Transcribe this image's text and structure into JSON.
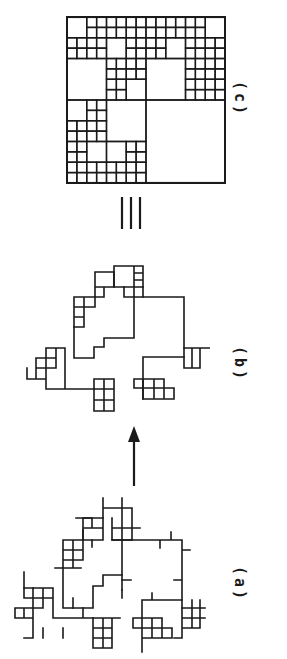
{
  "figure": {
    "orientation": "rotated-90-clockwise",
    "ink_color": "#1a1a1a",
    "background_color": "#ffffff",
    "panels": [
      {
        "id": "a",
        "label": "(a)",
        "description": "Fractal lattice cluster with dangling bonds and small square loops"
      },
      {
        "id": "b",
        "label": "(b)",
        "description": "Reduced cluster: backbone with blobs of unit cells (dangling ends removed)"
      },
      {
        "id": "c",
        "label": "(c)",
        "description": "Equivalent quadtree-like hierarchical square tiling on a 16x16 grid"
      }
    ],
    "connectors": [
      {
        "from": "a",
        "to": "b",
        "symbol": "arrow"
      },
      {
        "from": "b",
        "to": "c",
        "symbol": "≡"
      }
    ]
  },
  "labels": {
    "a": "(a)",
    "b": "(b)",
    "c": "(c)",
    "equiv": "≡"
  },
  "quadtree": {
    "grid": 16,
    "big_cells": [
      {
        "x": 0,
        "y": 0,
        "s": 2
      },
      {
        "x": 14,
        "y": 0,
        "s": 2
      },
      {
        "x": 4,
        "y": 2,
        "s": 2
      },
      {
        "x": 10,
        "y": 2,
        "s": 2
      },
      {
        "x": 0,
        "y": 4,
        "s": 4
      },
      {
        "x": 6,
        "y": 6,
        "s": 2
      },
      {
        "x": 8,
        "y": 4,
        "s": 4
      },
      {
        "x": 0,
        "y": 8,
        "s": 2
      },
      {
        "x": 4,
        "y": 8,
        "s": 4
      },
      {
        "x": 2,
        "y": 12,
        "s": 2
      },
      {
        "x": 4,
        "y": 12,
        "s": 2
      },
      {
        "x": 8,
        "y": 8,
        "s": 8
      }
    ]
  }
}
